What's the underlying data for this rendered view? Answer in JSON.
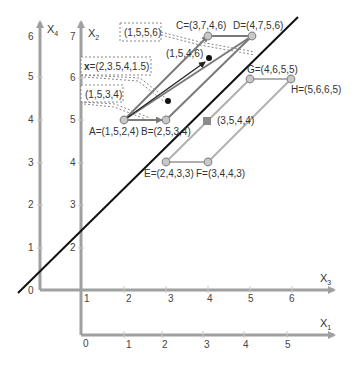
{
  "axes": {
    "x4": {
      "label": "X",
      "sub": "4",
      "ticks": [
        "0",
        "1",
        "2",
        "3",
        "4",
        "5",
        "6"
      ]
    },
    "x2": {
      "label": "X",
      "sub": "2",
      "ticks": [
        "2",
        "3",
        "4",
        "5",
        "6",
        "7"
      ]
    },
    "x3": {
      "label": "X",
      "sub": "3",
      "ticks": [
        "1",
        "2",
        "3",
        "4",
        "5",
        "6"
      ]
    },
    "x1": {
      "label": "X",
      "sub": "1",
      "ticks": [
        "0",
        "1",
        "2",
        "3",
        "4",
        "5"
      ]
    }
  },
  "points": {
    "A": "A=(1,5,2,4)",
    "B": "B=(2,5,3,4)",
    "C": "C=(3,7,4,6)",
    "D": "D=(4,7,5,6)",
    "E": "E=(2,4,3,3)",
    "F": "F=(3,4,4,3)",
    "G": "G=(4,6,5,5)",
    "H": "H=(5,6,6,5)",
    "mid": "(3,5,4,4)",
    "arrow_tip": "(1,5,4,6)"
  },
  "callouts": {
    "c1": "(1,5,5,6)",
    "x_prefix": "x",
    "x_value": "=(2,3.5,4,1.5)",
    "c3": "(1,5,3,4)"
  },
  "colors": {
    "axis": "#a0a0a0",
    "edge": "#7a7a7a",
    "edge_light": "#b0b0b0",
    "point_fill": "#c8c8c8",
    "separator": "#111111",
    "dot": "#111111"
  }
}
